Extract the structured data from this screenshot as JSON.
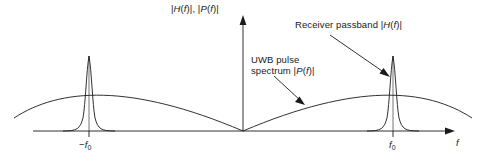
{
  "figure": {
    "title": "",
    "background_color": "#ffffff",
    "line_color": "#1a1a1a",
    "text_color": "#1a1a1a"
  },
  "axes": {
    "y_label_html": "|<i>H</i>(<i>f</i>)|, |<i>P</i>(<i>f</i>)|",
    "y_label_text": "|H(f)|, |P(f)|",
    "x_label_html": "<i>f</i>",
    "x_label_text": "f",
    "ticks": [
      {
        "id": "neg-f0",
        "html": "−<i>f</i><span class=\"sub\">0</span>",
        "text": "-f0",
        "x": 89
      },
      {
        "id": "pos-f0",
        "html": "<i>f</i><span class=\"sub\">0</span>",
        "text": "f0",
        "x": 393
      }
    ],
    "origin_x": 243,
    "baseline_y": 131
  },
  "annotations": [
    {
      "id": "receiver-passband",
      "html": "Receiver passband |<i>H</i>(<i>f</i>)|",
      "text": "Receiver passband |H(f)|",
      "points_to": "right-peak"
    },
    {
      "id": "uwb-pulse-spectrum",
      "html": "UWB pulse<br>spectrum |<i>P</i>(<i>f</i>)|",
      "text": "UWB pulse spectrum |P(f)|",
      "points_to": "uwb-curve"
    }
  ],
  "chart_data": {
    "type": "line",
    "title": "",
    "xlabel": "f",
    "ylabel": "|H(f)|, |P(f)|",
    "xticklabels": [
      "-f0",
      "f0"
    ],
    "grid": false,
    "legend": "none",
    "series": [
      {
        "name": "Receiver passband |H(f)|",
        "description": "Two narrow resonant peaks centered at -f0 and +f0",
        "peaks": [
          {
            "center": "-f0",
            "height": 1.0,
            "halfwidth": 0.03
          },
          {
            "center": "f0",
            "height": 1.0,
            "halfwidth": 0.03
          }
        ]
      },
      {
        "name": "UWB pulse spectrum |P(f)|",
        "description": "Broad dome-shaped spectrum, zero at f=0, maximum near +/-f0",
        "x": [
          -1.35,
          -1.0,
          -0.7,
          -0.35,
          0.0,
          0.35,
          0.7,
          1.0,
          1.35
        ],
        "values": [
          0.46,
          0.6,
          0.5,
          0.25,
          0.0,
          0.25,
          0.5,
          0.6,
          0.46
        ]
      }
    ]
  }
}
